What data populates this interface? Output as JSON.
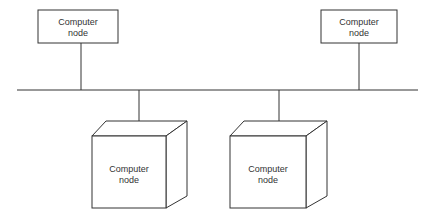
{
  "diagram": {
    "type": "bus network",
    "bus": {
      "label": ""
    },
    "nodes": [
      {
        "id": "top-left",
        "style": "box",
        "line1": "Computer",
        "line2": "node"
      },
      {
        "id": "top-right",
        "style": "box",
        "line1": "Computer",
        "line2": "node"
      },
      {
        "id": "bottom-left",
        "style": "cube",
        "line1": "Computer",
        "line2": "node"
      },
      {
        "id": "bottom-right",
        "style": "cube",
        "line1": "Computer",
        "line2": "node"
      }
    ],
    "colors": {
      "stroke": "#333333",
      "background": "#ffffff"
    }
  }
}
